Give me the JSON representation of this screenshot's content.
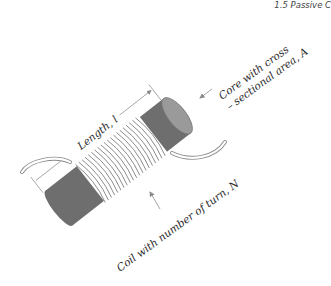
{
  "header": {
    "section_title": "1.5 Passive C"
  },
  "diagram": {
    "labels": {
      "length": "Length, l",
      "core_line1": "Core with cross",
      "core_line2": "– sectional area, A",
      "coil": "Coil with number of turn, N"
    },
    "colors": {
      "core": "#6e6e6e",
      "core_end": "#9a9a9a",
      "coil_stroke": "#8a8a8a",
      "coil_fill": "#ffffff",
      "arrow": "#9a9a9a"
    }
  }
}
